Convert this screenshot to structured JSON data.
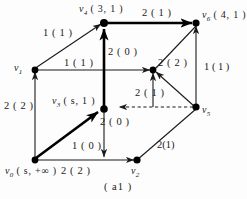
{
  "figure": {
    "caption": "( a1 )",
    "nodes": [
      {
        "id": "v0",
        "name": "v",
        "sub": "0",
        "value": "( s,  +∞ )",
        "label": "v0 (s, +∞)"
      },
      {
        "id": "v1",
        "name": "v",
        "sub": "1",
        "value": "",
        "label": "v1"
      },
      {
        "id": "v2",
        "name": "v",
        "sub": "2",
        "value": "",
        "label": "v2"
      },
      {
        "id": "v3",
        "name": "v",
        "sub": "3",
        "value": "( s,  1 )",
        "label": "v3 (s, 1)"
      },
      {
        "id": "v4",
        "name": "v",
        "sub": "4",
        "value": "( 3,  1 )",
        "label": "v4 (3, 1)"
      },
      {
        "id": "v5",
        "name": "v",
        "sub": "5",
        "value": "",
        "label": "v5"
      },
      {
        "id": "v6",
        "name": "v",
        "sub": "6",
        "value": "( 4,  1 )",
        "label": "v6 (4, 1)"
      }
    ],
    "edge_labels": [
      {
        "id": "e-v4-v6-top",
        "text": "2 ( 1 )"
      },
      {
        "id": "e-v1-v4",
        "text": "1 ( 1 )"
      },
      {
        "id": "e-v3-v4",
        "text": "2 ( 0 )"
      },
      {
        "id": "e-v1-v3prime",
        "text": "1 ( 1 )"
      },
      {
        "id": "e-v5-v3prime",
        "text": "2 ( 2 )"
      },
      {
        "id": "e-v6-v5",
        "text": "1 ( 1 )"
      },
      {
        "id": "e-v0-v1",
        "text": "2 ( 2 )"
      },
      {
        "id": "e-v5-v3-dashed",
        "text": "2 ( 1 )"
      },
      {
        "id": "e-v0-v3",
        "text": "2 ( 0 )"
      },
      {
        "id": "e-v3-v2",
        "text": "1 ( 0 )"
      },
      {
        "id": "e-v0-v2",
        "text": "2 ( 2 )"
      },
      {
        "id": "e-v2-v5",
        "text": "2(1)"
      }
    ],
    "colors": {
      "stroke": "#1a1a1a",
      "thick_stroke": "#000000",
      "background": "#fdfdfd"
    }
  }
}
